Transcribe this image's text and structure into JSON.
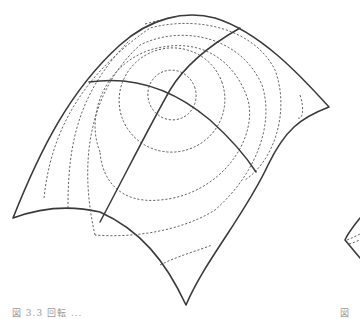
{
  "figure": {
    "caption_left": "図 3.3   回転 ...",
    "caption_right": "図",
    "stroke_color": "#3a3a3a",
    "contour_count": 6,
    "grid_lines": 2
  }
}
